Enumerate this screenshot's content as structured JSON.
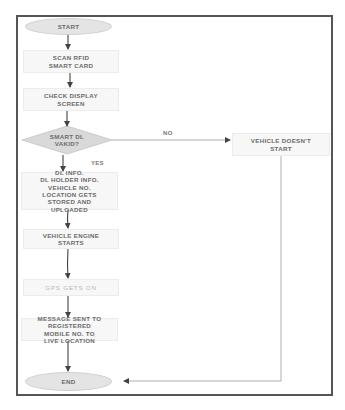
{
  "flowchart": {
    "nodes": {
      "start": {
        "label": "START",
        "shape": "ellipse"
      },
      "scan": {
        "label": "SCAN RFID\nSMART CARD",
        "shape": "process"
      },
      "check_display": {
        "label": "CHECK DISPLAY\nSCREEN",
        "shape": "process"
      },
      "decision": {
        "label": "SMART DL\nVAKID?",
        "shape": "decision"
      },
      "dl_info": {
        "label": "DL INFO.\nDL HOLDER INFO.\nVEHICLE NO.\nLOCATION GETS\nSTORED AND\nUPLOADED",
        "shape": "process"
      },
      "engine_starts": {
        "label": "VEHICLE ENGINE\nSTARTS",
        "shape": "process"
      },
      "gps": {
        "label": "GPS GETS ON",
        "shape": "process"
      },
      "message": {
        "label": "MESSAGE SENT TO\nREGISTERED\nMOBILE NO. TO\nLIVE LOCATION",
        "shape": "process"
      },
      "vehicle_no_start": {
        "label": "VEHICLE DOESN'T\nSTART",
        "shape": "process"
      },
      "end": {
        "label": "END",
        "shape": "ellipse"
      }
    },
    "edge_labels": {
      "yes": "YES",
      "no": "NO"
    },
    "edges": [
      {
        "from": "start",
        "to": "scan"
      },
      {
        "from": "scan",
        "to": "check_display"
      },
      {
        "from": "check_display",
        "to": "decision"
      },
      {
        "from": "decision",
        "to": "dl_info",
        "label": "YES"
      },
      {
        "from": "decision",
        "to": "vehicle_no_start",
        "label": "NO"
      },
      {
        "from": "dl_info",
        "to": "engine_starts"
      },
      {
        "from": "engine_starts",
        "to": "gps"
      },
      {
        "from": "gps",
        "to": "message"
      },
      {
        "from": "message",
        "to": "end"
      },
      {
        "from": "vehicle_no_start",
        "to": "end"
      }
    ],
    "colors": {
      "frame": "#555555",
      "box_fill": "#f7f7f7",
      "ellipse_fill": "#e4e4e4",
      "diamond_fill": "#d9d9d9",
      "text": "#6b6b6b",
      "line": "#666666"
    }
  }
}
